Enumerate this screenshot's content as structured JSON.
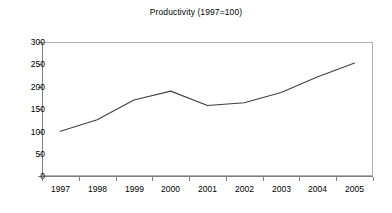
{
  "chart_data": {
    "type": "line",
    "title": "Productivity (1997=100)",
    "xlabel": "",
    "ylabel": "",
    "categories": [
      "1997",
      "1998",
      "1999",
      "2000",
      "2001",
      "2002",
      "2003",
      "2004",
      "2005"
    ],
    "series": [
      {
        "name": "Productivity",
        "values": [
          100,
          126,
          170,
          190,
          158,
          164,
          187,
          222,
          253
        ],
        "color": "#404040"
      }
    ],
    "ylim": [
      0,
      300
    ],
    "yticks": [
      0,
      50,
      100,
      150,
      200,
      250,
      300
    ],
    "ytick_labels": [
      "0",
      "50",
      "100",
      "150",
      "200",
      "250",
      "300"
    ],
    "grid": false,
    "legend": "none",
    "frame_color": "#b0b0b0",
    "axis_color": "#808080",
    "background": "#ffffff"
  }
}
